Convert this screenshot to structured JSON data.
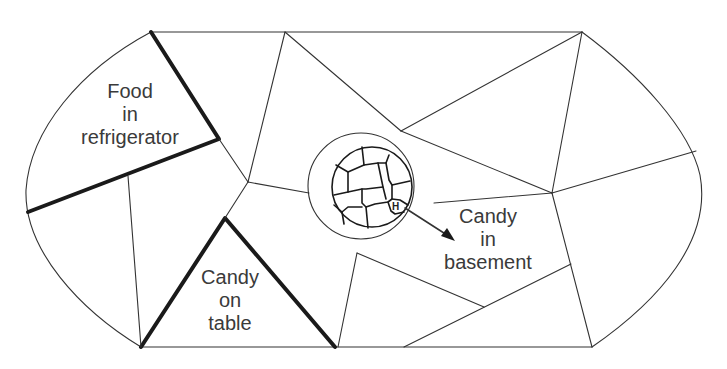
{
  "diagram": {
    "type": "cognitive-map",
    "labels": {
      "food_refrigerator": [
        "Food",
        "in",
        "refrigerator"
      ],
      "candy_table": [
        "Candy",
        "on",
        "table"
      ],
      "candy_basement": [
        "Candy",
        "in",
        "basement"
      ],
      "marker": "H"
    },
    "colors": {
      "line": "#333333",
      "thick_boundary": "#1a1a1a",
      "text": "#3a3a3a",
      "background": "#ffffff"
    }
  }
}
